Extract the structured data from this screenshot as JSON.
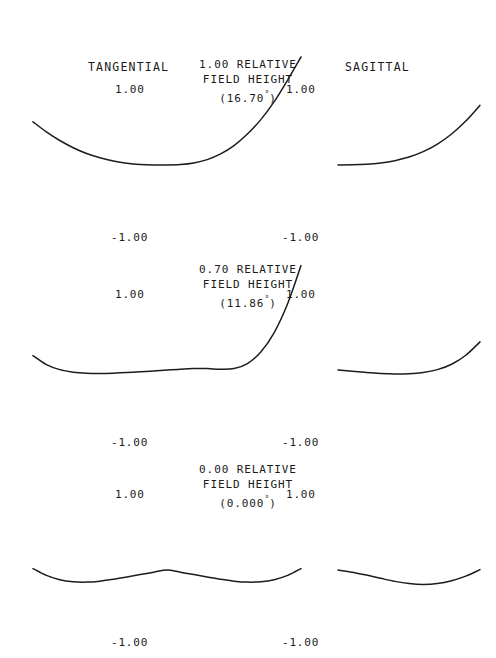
{
  "figure": {
    "kind": "ray-aberration-fan",
    "background": "#ffffff",
    "ink": "#1c1c1c",
    "columns": [
      {
        "key": "tangential",
        "label": "TANGENTIAL"
      },
      {
        "key": "sagittal",
        "label": "SAGITTAL"
      }
    ],
    "tick_top": "1.00",
    "tick_bottom": "-1.00"
  },
  "rows": [
    {
      "relative": "1.00 RELATIVE",
      "line2": "FIELD HEIGHT",
      "angle": "(16.70",
      "angle_deg": "°",
      "angle_close": ")",
      "angle_full": "(16.70°)"
    },
    {
      "relative": "0.70 RELATIVE",
      "line2": "FIELD HEIGHT",
      "angle": "(11.86",
      "angle_deg": "°",
      "angle_close": ")",
      "angle_full": "(11.86°)"
    },
    {
      "relative": "0.00 RELATIVE",
      "line2": "FIELD HEIGHT",
      "angle": "(0.000",
      "angle_deg": "°",
      "angle_close": ")",
      "angle_full": "(0.000°)"
    }
  ],
  "chart_data": {
    "type": "line",
    "xlabel": "Normalized pupil coordinate",
    "ylabel": "Transverse ray aberration",
    "ylim": [
      -1.0,
      1.0
    ],
    "yticks": [
      1.0,
      -1.0
    ],
    "grid": false,
    "legend": "none",
    "panels": [
      {
        "row": 0,
        "column": "tangential",
        "field": "1.00 RELATIVE FIELD HEIGHT",
        "angle_deg": 16.7,
        "xlim": [
          -1.0,
          1.0
        ],
        "x": [
          -1.0,
          -0.9,
          -0.8,
          -0.7,
          -0.6,
          -0.5,
          -0.4,
          -0.3,
          -0.2,
          -0.1,
          0.0,
          0.1,
          0.2,
          0.3,
          0.4,
          0.5,
          0.6,
          0.7,
          0.8,
          0.9,
          1.0
        ],
        "y": [
          0.6,
          0.46,
          0.34,
          0.24,
          0.16,
          0.1,
          0.055,
          0.025,
          0.008,
          0.001,
          0.0,
          0.006,
          0.028,
          0.075,
          0.155,
          0.27,
          0.43,
          0.63,
          0.88,
          1.18,
          1.5
        ]
      },
      {
        "row": 0,
        "column": "sagittal",
        "field": "1.00 RELATIVE FIELD HEIGHT",
        "angle_deg": 16.7,
        "xlim": [
          0.0,
          1.0
        ],
        "x": [
          0.0,
          0.1,
          0.2,
          0.3,
          0.4,
          0.5,
          0.6,
          0.7,
          0.8,
          0.9,
          1.0
        ],
        "y": [
          0.0,
          0.002,
          0.01,
          0.028,
          0.06,
          0.11,
          0.185,
          0.29,
          0.43,
          0.61,
          0.83
        ]
      },
      {
        "row": 1,
        "column": "tangential",
        "field": "0.70 RELATIVE FIELD HEIGHT",
        "angle_deg": 11.86,
        "xlim": [
          -1.0,
          1.0
        ],
        "x": [
          -1.0,
          -0.9,
          -0.8,
          -0.7,
          -0.6,
          -0.5,
          -0.4,
          -0.3,
          -0.2,
          -0.1,
          0.0,
          0.1,
          0.2,
          0.3,
          0.4,
          0.5,
          0.6,
          0.7,
          0.8,
          0.9,
          1.0
        ],
        "y": [
          0.2,
          0.075,
          0.005,
          -0.03,
          -0.045,
          -0.048,
          -0.044,
          -0.036,
          -0.026,
          -0.014,
          0.0,
          0.012,
          0.02,
          0.02,
          0.01,
          0.02,
          0.09,
          0.25,
          0.52,
          0.92,
          1.45
        ]
      },
      {
        "row": 1,
        "column": "sagittal",
        "field": "0.70 RELATIVE FIELD HEIGHT",
        "angle_deg": 11.86,
        "xlim": [
          0.0,
          1.0
        ],
        "x": [
          0.0,
          0.1,
          0.2,
          0.3,
          0.4,
          0.5,
          0.6,
          0.7,
          0.8,
          0.9,
          1.0
        ],
        "y": [
          0.0,
          -0.018,
          -0.035,
          -0.048,
          -0.055,
          -0.052,
          -0.035,
          0.005,
          0.08,
          0.205,
          0.39
        ]
      },
      {
        "row": 2,
        "column": "tangential",
        "field": "0.00 RELATIVE FIELD HEIGHT",
        "angle_deg": 0.0,
        "xlim": [
          -1.0,
          1.0
        ],
        "x": [
          -1.0,
          -0.9,
          -0.8,
          -0.7,
          -0.6,
          -0.5,
          -0.4,
          -0.3,
          -0.2,
          -0.1,
          0.0,
          0.1,
          0.2,
          0.3,
          0.4,
          0.5,
          0.6,
          0.7,
          0.8,
          0.9,
          1.0
        ],
        "y": [
          0.02,
          -0.075,
          -0.135,
          -0.163,
          -0.168,
          -0.155,
          -0.13,
          -0.098,
          -0.064,
          -0.031,
          0.0,
          -0.031,
          -0.064,
          -0.098,
          -0.13,
          -0.155,
          -0.168,
          -0.163,
          -0.135,
          -0.075,
          0.02
        ]
      },
      {
        "row": 2,
        "column": "sagittal",
        "field": "0.00 RELATIVE FIELD HEIGHT",
        "angle_deg": 0.0,
        "xlim": [
          0.0,
          1.0
        ],
        "x": [
          0.0,
          0.1,
          0.2,
          0.3,
          0.4,
          0.5,
          0.6,
          0.7,
          0.8,
          0.9,
          1.0
        ],
        "y": [
          0.0,
          -0.03,
          -0.07,
          -0.115,
          -0.158,
          -0.188,
          -0.2,
          -0.188,
          -0.148,
          -0.085,
          0.005
        ]
      }
    ]
  },
  "geometry": {
    "rows_y_axis": [
      165,
      370,
      570
    ],
    "row_half_height": 78,
    "tangential": {
      "origin_x": 167,
      "x_left": 33,
      "x_right": 480
    },
    "sagittal": {
      "origin_x": 338,
      "x_left": 338,
      "x_right": 480
    },
    "x_unit_tangential": 134,
    "x_unit_sagittal": 142,
    "y_unit": 72
  },
  "labels": {
    "tangential_head": {
      "x": 88,
      "y": 60
    },
    "sagittal_head": {
      "x": 345,
      "y": 60
    },
    "tick_top_offset_x": -52,
    "tick_bottom_offset_x": -56,
    "field_blocks": [
      {
        "x": 248,
        "y": 57
      },
      {
        "x": 248,
        "y": 262
      },
      {
        "x": 248,
        "y": 462
      }
    ]
  }
}
